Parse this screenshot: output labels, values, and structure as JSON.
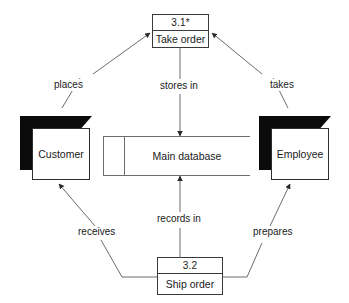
{
  "diagram": {
    "type": "data-flow-diagram",
    "title": "",
    "processes": [
      {
        "id": "3.1*",
        "name": "Take order"
      },
      {
        "id": "3.2",
        "name": "Ship order"
      }
    ],
    "entities": [
      {
        "name": "Customer"
      },
      {
        "name": "Employee"
      }
    ],
    "datastores": [
      {
        "name": "Main database"
      }
    ],
    "flows": [
      {
        "label": "places",
        "from": "Customer",
        "to": "Take order"
      },
      {
        "label": "stores in",
        "from": "Take order",
        "to": "Main database"
      },
      {
        "label": "takes",
        "from": "Employee",
        "to": "Take order"
      },
      {
        "label": "receives",
        "from": "Ship order",
        "to": "Customer"
      },
      {
        "label": "records in",
        "from": "Ship order",
        "to": "Main database"
      },
      {
        "label": "prepares",
        "from": "Ship order",
        "to": "Employee"
      }
    ],
    "colors": {
      "background": "#ffffff",
      "stroke": "#3a3a3a",
      "edge": "#6d6d6d",
      "entity_shadow": "#0b0b0b",
      "text": "#1a1a1a"
    }
  }
}
